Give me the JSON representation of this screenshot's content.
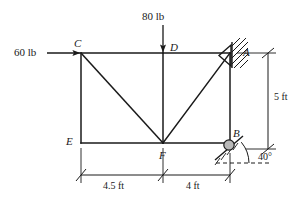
{
  "figure": {
    "type": "truss-free-body-diagram",
    "title": "",
    "stroke_color": "#1a1a1a",
    "roller_fill": "#b9b9b9"
  },
  "nodes": [
    {
      "id": "C",
      "label": "C",
      "x": 81,
      "y": 53,
      "label_x": 74,
      "label_y": 38
    },
    {
      "id": "D",
      "label": "D",
      "x": 163,
      "y": 53,
      "label_x": 170,
      "label_y": 42
    },
    {
      "id": "A",
      "label": "A",
      "x": 230,
      "y": 53,
      "label_x": 243,
      "label_y": 47
    },
    {
      "id": "E",
      "label": "E",
      "x": 81,
      "y": 143,
      "label_x": 66,
      "label_y": 136
    },
    {
      "id": "F",
      "label": "F",
      "x": 163,
      "y": 143,
      "label_x": 159,
      "label_y": 150
    },
    {
      "id": "B",
      "label": "B",
      "x": 230,
      "y": 143,
      "label_x": 233,
      "label_y": 128
    }
  ],
  "members": [
    {
      "from": "C",
      "to": "D"
    },
    {
      "from": "D",
      "to": "A"
    },
    {
      "from": "C",
      "to": "E"
    },
    {
      "from": "E",
      "to": "F"
    },
    {
      "from": "F",
      "to": "B"
    },
    {
      "from": "A",
      "to": "B"
    },
    {
      "from": "C",
      "to": "F"
    },
    {
      "from": "F",
      "to": "A"
    },
    {
      "from": "D",
      "to": "F"
    }
  ],
  "loads": [
    {
      "id": "load-60",
      "label": "60 lb",
      "magnitude": 60,
      "unit": "lb",
      "direction": "right",
      "applied_at": "C",
      "label_x": 14,
      "label_y": 47
    },
    {
      "id": "load-80",
      "label": "80 lb",
      "magnitude": 80,
      "unit": "lb",
      "direction": "down",
      "applied_at": "D",
      "label_x": 142,
      "label_y": 11
    }
  ],
  "supports": [
    {
      "id": "pin-support-a",
      "type": "pin",
      "at": "A",
      "description": "fixed pin support with hatching"
    },
    {
      "id": "roller-support-b",
      "type": "roller-on-incline",
      "at": "B",
      "angle_label": "40°",
      "angle_value": 40,
      "angle_label_x": 258,
      "angle_label_y": 152
    }
  ],
  "dimensions": [
    {
      "id": "dim-horizontal-left",
      "label": "4.5 ft",
      "value": 4.5,
      "unit": "ft",
      "label_x": 103,
      "label_y": 181
    },
    {
      "id": "dim-horizontal-right",
      "label": "4 ft",
      "value": 4,
      "unit": "ft",
      "label_x": 186,
      "label_y": 181
    },
    {
      "id": "dim-vertical-right",
      "label": "5 ft",
      "value": 5,
      "unit": "ft",
      "label_x": 274,
      "label_y": 92
    }
  ]
}
